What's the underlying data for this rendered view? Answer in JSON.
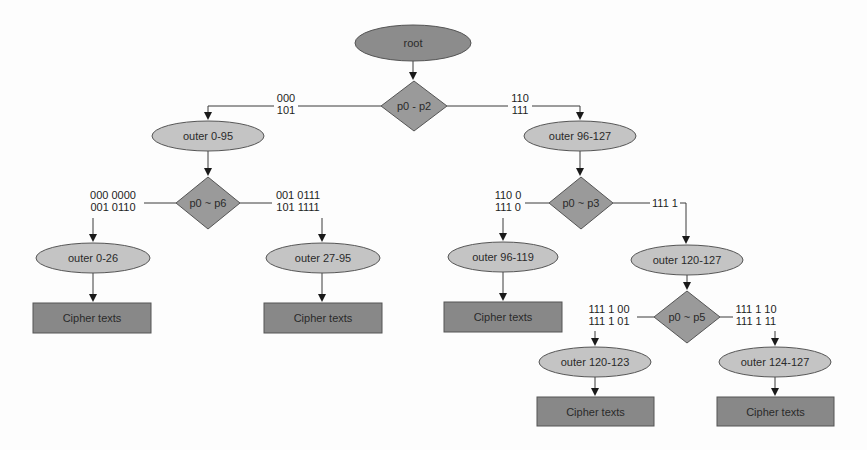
{
  "diagram": {
    "title": "",
    "colors": {
      "root_fill": "#8c8c8c",
      "decision_fill": "#9a9a9a",
      "range_fill": "#c4c4c4",
      "cipher_fill": "#888888",
      "stroke": "#555555",
      "edge": "#3a3a3a",
      "background": "#fdfdfd"
    },
    "nodes": [
      {
        "id": "root",
        "type": "root-ellipse",
        "label": "root",
        "cx": 413,
        "cy": 43,
        "rx": 58,
        "ry": 18
      },
      {
        "id": "d1",
        "type": "decision",
        "label": "p0 - p2",
        "cx": 414,
        "cy": 106,
        "hw": 33,
        "hh": 25
      },
      {
        "id": "o1",
        "type": "range-ellipse",
        "label": "outer 0-95",
        "cx": 208,
        "cy": 136,
        "rx": 56,
        "ry": 15
      },
      {
        "id": "o2",
        "type": "range-ellipse",
        "label": "outer 96-127",
        "cx": 580,
        "cy": 136,
        "rx": 56,
        "ry": 15
      },
      {
        "id": "d2",
        "type": "decision",
        "label": "p0 ~ p6",
        "cx": 208,
        "cy": 203,
        "hw": 32,
        "hh": 26
      },
      {
        "id": "d3",
        "type": "decision",
        "label": "p0 ~ p3",
        "cx": 581,
        "cy": 203,
        "hw": 32,
        "hh": 26
      },
      {
        "id": "o3",
        "type": "range-ellipse",
        "label": "outer 0-26",
        "cx": 93,
        "cy": 258,
        "rx": 57,
        "ry": 15
      },
      {
        "id": "o4",
        "type": "range-ellipse",
        "label": "outer 27-95",
        "cx": 323,
        "cy": 258,
        "rx": 57,
        "ry": 15
      },
      {
        "id": "o5",
        "type": "range-ellipse",
        "label": "outer 96-119",
        "cx": 503,
        "cy": 257,
        "rx": 55,
        "ry": 15
      },
      {
        "id": "o6",
        "type": "range-ellipse",
        "label": "outer 120-127",
        "cx": 687,
        "cy": 260,
        "rx": 56,
        "ry": 15
      },
      {
        "id": "c1",
        "type": "cipher-box",
        "label": "Cipher texts",
        "x": 33,
        "y": 303,
        "w": 118,
        "h": 30
      },
      {
        "id": "c2",
        "type": "cipher-box",
        "label": "Cipher texts",
        "x": 264,
        "y": 303,
        "w": 118,
        "h": 30
      },
      {
        "id": "c3",
        "type": "cipher-box",
        "label": "Cipher texts",
        "x": 444,
        "y": 302,
        "w": 118,
        "h": 30
      },
      {
        "id": "d4",
        "type": "decision",
        "label": "p0 ~ p5",
        "cx": 687,
        "cy": 317,
        "hw": 33,
        "hh": 26
      },
      {
        "id": "o7",
        "type": "range-ellipse",
        "label": "outer 120-123",
        "cx": 595,
        "cy": 362,
        "rx": 56,
        "ry": 15
      },
      {
        "id": "o8",
        "type": "range-ellipse",
        "label": "outer 124-127",
        "cx": 775,
        "cy": 362,
        "rx": 56,
        "ry": 15
      },
      {
        "id": "c4",
        "type": "cipher-box",
        "label": "Cipher texts",
        "x": 537,
        "y": 397,
        "w": 117,
        "h": 29
      },
      {
        "id": "c5",
        "type": "cipher-box",
        "label": "Cipher texts",
        "x": 717,
        "y": 397,
        "w": 117,
        "h": 29
      }
    ],
    "edges": [
      {
        "from": "root",
        "to": "d1",
        "points": [
          [
            413,
            61
          ],
          [
            413,
            80
          ]
        ],
        "arrow": true
      },
      {
        "from": "d1",
        "to": "o1",
        "points": [
          [
            381,
            106
          ],
          [
            298,
            106
          ]
        ],
        "arrow": false
      },
      {
        "from": "d1",
        "to": "o1",
        "points": [
          [
            274,
            106
          ],
          [
            208,
            106
          ],
          [
            208,
            120
          ]
        ],
        "arrow": true
      },
      {
        "from": "d1",
        "to": "o2",
        "points": [
          [
            447,
            106
          ],
          [
            508,
            106
          ]
        ],
        "arrow": false
      },
      {
        "from": "d1",
        "to": "o2",
        "points": [
          [
            532,
            106
          ],
          [
            580,
            106
          ],
          [
            580,
            120
          ]
        ],
        "arrow": true
      },
      {
        "from": "o1",
        "to": "d2",
        "points": [
          [
            208,
            151
          ],
          [
            208,
            176
          ]
        ],
        "arrow": true
      },
      {
        "from": "o2",
        "to": "d3",
        "points": [
          [
            580,
            151
          ],
          [
            580,
            176
          ]
        ],
        "arrow": true
      },
      {
        "from": "d2",
        "to": "o3",
        "points": [
          [
            176,
            203
          ],
          [
            144,
            203
          ]
        ],
        "arrow": false
      },
      {
        "from": "d2",
        "to": "o3",
        "points": [
          [
            93,
            218
          ],
          [
            93,
            242
          ]
        ],
        "arrow": true
      },
      {
        "from": "d2",
        "to": "o4",
        "points": [
          [
            240,
            203
          ],
          [
            272,
            203
          ]
        ],
        "arrow": false
      },
      {
        "from": "d2",
        "to": "o4",
        "points": [
          [
            322,
            218
          ],
          [
            322,
            242
          ]
        ],
        "arrow": true
      },
      {
        "from": "o3",
        "to": "c1",
        "points": [
          [
            93,
            273
          ],
          [
            93,
            302
          ]
        ],
        "arrow": true
      },
      {
        "from": "o4",
        "to": "c2",
        "points": [
          [
            322,
            273
          ],
          [
            322,
            302
          ]
        ],
        "arrow": true
      },
      {
        "from": "d3",
        "to": "o5",
        "points": [
          [
            549,
            203
          ],
          [
            525,
            203
          ]
        ],
        "arrow": false
      },
      {
        "from": "d3",
        "to": "o5",
        "points": [
          [
            503,
            218
          ],
          [
            503,
            241
          ]
        ],
        "arrow": true
      },
      {
        "from": "d3",
        "to": "o6",
        "points": [
          [
            613,
            203
          ],
          [
            650,
            203
          ]
        ],
        "arrow": false
      },
      {
        "from": "d3",
        "to": "o6",
        "points": [
          [
            680,
            203
          ],
          [
            686,
            203
          ],
          [
            686,
            244
          ]
        ],
        "arrow": true
      },
      {
        "from": "o5",
        "to": "c3",
        "points": [
          [
            503,
            272
          ],
          [
            503,
            301
          ]
        ],
        "arrow": true
      },
      {
        "from": "o6",
        "to": "d4",
        "points": [
          [
            687,
            275
          ],
          [
            687,
            290
          ]
        ],
        "arrow": true
      },
      {
        "from": "d4",
        "to": "o7",
        "points": [
          [
            654,
            317
          ],
          [
            637,
            317
          ]
        ],
        "arrow": false
      },
      {
        "from": "d4",
        "to": "o7",
        "points": [
          [
            595,
            331
          ],
          [
            595,
            346
          ]
        ],
        "arrow": true
      },
      {
        "from": "d4",
        "to": "o8",
        "points": [
          [
            720,
            317
          ],
          [
            733,
            317
          ]
        ],
        "arrow": false
      },
      {
        "from": "d4",
        "to": "o8",
        "points": [
          [
            775,
            331
          ],
          [
            775,
            346
          ]
        ],
        "arrow": true
      },
      {
        "from": "o7",
        "to": "c4",
        "points": [
          [
            595,
            377
          ],
          [
            595,
            396
          ]
        ],
        "arrow": true
      },
      {
        "from": "o8",
        "to": "c5",
        "points": [
          [
            775,
            377
          ],
          [
            775,
            396
          ]
        ],
        "arrow": true
      }
    ],
    "edge_labels": [
      {
        "id": "l1",
        "lines": [
          "000",
          "101"
        ],
        "x": 286,
        "y": 102,
        "anchor": "middle"
      },
      {
        "id": "l2",
        "lines": [
          "110",
          "111"
        ],
        "x": 520,
        "y": 102,
        "anchor": "middle"
      },
      {
        "id": "l3",
        "lines": [
          "000 0000",
          "001 0110"
        ],
        "x": 113,
        "y": 199,
        "anchor": "middle"
      },
      {
        "id": "l4",
        "lines": [
          "001 0111",
          "101 1111"
        ],
        "x": 298,
        "y": 199,
        "anchor": "middle"
      },
      {
        "id": "l5",
        "lines": [
          "110 0",
          "111 0"
        ],
        "x": 508,
        "y": 199,
        "anchor": "middle"
      },
      {
        "id": "l6",
        "lines": [
          "111 1"
        ],
        "x": 665,
        "y": 207,
        "anchor": "middle"
      },
      {
        "id": "l7",
        "lines": [
          "111 1 00",
          "111 1 01"
        ],
        "x": 609,
        "y": 313,
        "anchor": "middle"
      },
      {
        "id": "l8",
        "lines": [
          "111 1 10",
          "111 1 11"
        ],
        "x": 756,
        "y": 313,
        "anchor": "middle"
      }
    ]
  }
}
